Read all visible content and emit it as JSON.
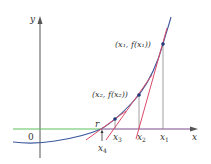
{
  "diagram": {
    "axes": {
      "x_label": "x",
      "y_label": "y",
      "origin_label": "0"
    },
    "root_label": "r",
    "points": [
      {
        "label_x": "x",
        "label_sub": "1",
        "coord_label": "(x₁, f(x₁))"
      },
      {
        "label_x": "x",
        "label_sub": "2",
        "coord_label": "(x₂, f(x₂))"
      },
      {
        "label_x": "x",
        "label_sub": "3"
      },
      {
        "label_x": "x",
        "label_sub": "4"
      }
    ],
    "colors": {
      "curve": "#3d5a9e",
      "tangent": "#d94a6a",
      "axis_left": "#5cc15c",
      "axis": "#555555",
      "point": "#1f3a7a",
      "guide": "#777777"
    }
  }
}
